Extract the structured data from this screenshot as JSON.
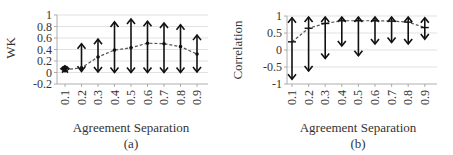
{
  "chart_data": [
    {
      "type": "line",
      "panel": "(a)",
      "title": "",
      "xlabel": "Agreement Separation",
      "ylabel": "WK",
      "categories": [
        "0.1",
        "0.2",
        "0.3",
        "0.4",
        "0.5",
        "0.6",
        "0.7",
        "0.8",
        "0.9"
      ],
      "series": [
        {
          "name": "mean",
          "style": "dashed",
          "values": [
            0.05,
            0.08,
            0.27,
            0.39,
            0.43,
            0.51,
            0.5,
            0.45,
            0.32
          ]
        },
        {
          "name": "range_high",
          "values": [
            0.05,
            0.5,
            0.58,
            0.88,
            0.93,
            0.89,
            0.86,
            0.83,
            0.65
          ]
        },
        {
          "name": "range_low",
          "values": [
            0.05,
            0.02,
            0.01,
            0.0,
            0.0,
            0.0,
            0.0,
            0.0,
            0.01
          ]
        }
      ],
      "yticks": [
        "1",
        "0.8",
        "0.6",
        "0.4",
        "0.2",
        "0",
        "-0.2"
      ],
      "ylim": [
        -0.2,
        1
      ],
      "grid": true,
      "caption": "(a)"
    },
    {
      "type": "line",
      "panel": "(b)",
      "title": "",
      "xlabel": "Agreement Separation",
      "ylabel": "Correlation",
      "categories": [
        "0.1",
        "0.2",
        "0.3",
        "0.4",
        "0.5",
        "0.6",
        "0.7",
        "0.8",
        "0.9"
      ],
      "series": [
        {
          "name": "mean",
          "style": "dashed",
          "values": [
            0.24,
            0.64,
            0.78,
            0.86,
            0.86,
            0.86,
            0.85,
            0.82,
            0.66
          ]
        },
        {
          "name": "range_high",
          "values": [
            0.95,
            0.97,
            0.97,
            0.97,
            0.97,
            0.97,
            0.97,
            0.97,
            0.95
          ]
        },
        {
          "name": "range_low",
          "values": [
            -0.86,
            -0.62,
            -0.25,
            0.12,
            -0.17,
            0.18,
            0.22,
            0.18,
            0.32
          ]
        }
      ],
      "yticks": [
        "1",
        "0.5",
        "0",
        "-0.5",
        "-1"
      ],
      "ylim": [
        -1,
        1
      ],
      "grid": true,
      "caption": "(b)"
    }
  ]
}
